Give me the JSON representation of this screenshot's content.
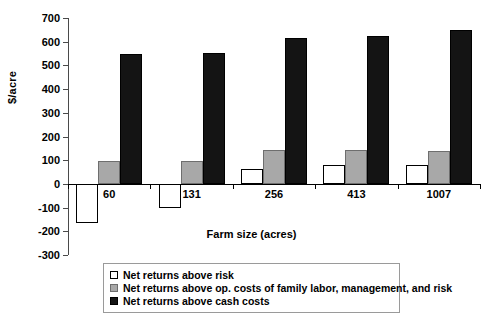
{
  "chart_data": {
    "type": "bar",
    "title": "",
    "xlabel": "Farm size (acres)",
    "ylabel": "$/acre",
    "categories": [
      "60",
      "131",
      "256",
      "413",
      "1007"
    ],
    "ylim": [
      -300,
      700
    ],
    "ytick_step": 100,
    "yticks": [
      700,
      600,
      500,
      400,
      300,
      200,
      100,
      0,
      -100,
      -200,
      -300
    ],
    "ytick_labels": [
      "700",
      "600",
      "500",
      "400",
      "300",
      "200",
      "100",
      "0",
      "-100",
      "-200",
      "-300"
    ],
    "grid": false,
    "legend_position": "below-plot",
    "series": [
      {
        "name": "Net returns above risk",
        "color": "#ffffff",
        "edge_color": "#000000",
        "values": [
          -165,
          -100,
          62,
          78,
          80
        ]
      },
      {
        "name": "Net returns above op. costs of family labor, management, and risk",
        "color": "#a8a8a8",
        "edge_color": "#6e6e6e",
        "values": [
          95,
          95,
          142,
          143,
          138
        ]
      },
      {
        "name": "Net returns above cash costs",
        "color": "#141414",
        "edge_color": "#000000",
        "values": [
          548,
          553,
          615,
          623,
          650
        ]
      }
    ]
  },
  "axis": {
    "y_title": "$/acre",
    "x_title": "Farm size (acres)"
  },
  "legend": {
    "items": [
      {
        "label": "Net returns above risk",
        "swatch": "white-square-icon"
      },
      {
        "label": "Net returns above op. costs of family labor, management, and risk",
        "swatch": "gray-square-icon"
      },
      {
        "label": "Net returns above cash costs",
        "swatch": "black-square-icon"
      }
    ]
  }
}
